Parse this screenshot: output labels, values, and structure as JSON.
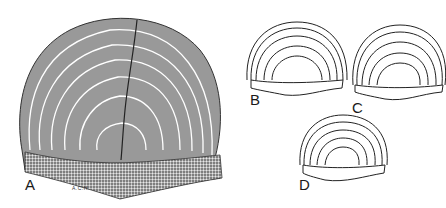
{
  "figure": {
    "panels": [
      {
        "label": "A",
        "description": "detailed hatched scale with concentric rings"
      },
      {
        "label": "B",
        "description": "outline scale, rings"
      },
      {
        "label": "C",
        "description": "outline scale, rings"
      },
      {
        "label": "D",
        "description": "outline scale, rings"
      }
    ],
    "signature": "A.C.H."
  }
}
